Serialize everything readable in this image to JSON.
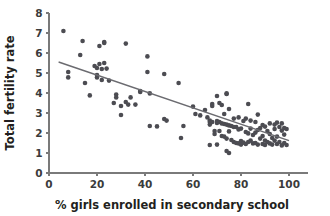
{
  "chart_data": {
    "type": "scatter",
    "title": "",
    "subtitle": "",
    "xlabel": "% girls enrolled in secondary school",
    "ylabel": "Total fertility rate",
    "xlim": [
      0,
      108
    ],
    "ylim": [
      0,
      8
    ],
    "xticks": [
      0,
      20,
      40,
      60,
      80,
      100
    ],
    "yticks": [
      0,
      1,
      2,
      3,
      4,
      5,
      6,
      7,
      8
    ],
    "xtick_labels": [
      "0",
      "20",
      "40",
      "60",
      "80",
      "100"
    ],
    "ytick_labels": [
      "0",
      "1",
      "2",
      "3",
      "4",
      "5",
      "6",
      "7",
      "8"
    ],
    "grid": false,
    "legend": null,
    "legend_position": "none",
    "marker_color": "#4c4c52",
    "marker_size": 2.3,
    "trendline": {
      "type": "linear-fit",
      "x": [
        4,
        100
      ],
      "y": [
        5.55,
        1.62
      ],
      "color": "#6b6b70",
      "slope": -0.0409,
      "intercept": 5.714
    },
    "points": [
      [
        6,
        7.1
      ],
      [
        8,
        5.05
      ],
      [
        8,
        4.78
      ],
      [
        13,
        5.9
      ],
      [
        14,
        6.6
      ],
      [
        15,
        4.5
      ],
      [
        17,
        3.88
      ],
      [
        19,
        5.35
      ],
      [
        20,
        5.25
      ],
      [
        20,
        4.9
      ],
      [
        20,
        4.78
      ],
      [
        21,
        6.35
      ],
      [
        21,
        5.45
      ],
      [
        22,
        5.2
      ],
      [
        22,
        4.65
      ],
      [
        23,
        6.55
      ],
      [
        23,
        6.5
      ],
      [
        23,
        5.5
      ],
      [
        24,
        5.22
      ],
      [
        25,
        4.62
      ],
      [
        27,
        3.5
      ],
      [
        28,
        3.92
      ],
      [
        28,
        3.78
      ],
      [
        30,
        3.35
      ],
      [
        30,
        2.9
      ],
      [
        32,
        6.47
      ],
      [
        32,
        3.55
      ],
      [
        33,
        3.42
      ],
      [
        34,
        3.78
      ],
      [
        36,
        3.42
      ],
      [
        38,
        4.1
      ],
      [
        38,
        4.05
      ],
      [
        41,
        5.83
      ],
      [
        41,
        5.05
      ],
      [
        42,
        3.98
      ],
      [
        42,
        2.35
      ],
      [
        45,
        2.33
      ],
      [
        48,
        4.95
      ],
      [
        48,
        2.7
      ],
      [
        49,
        2.62
      ],
      [
        54,
        4.5
      ],
      [
        55,
        1.75
      ],
      [
        56,
        2.35
      ],
      [
        60,
        3.32
      ],
      [
        61,
        2.95
      ],
      [
        63,
        2.88
      ],
      [
        65,
        3.15
      ],
      [
        66,
        2.78
      ],
      [
        67,
        2.62
      ],
      [
        67,
        2.55
      ],
      [
        67,
        2.42
      ],
      [
        67,
        1.4
      ],
      [
        68,
        3.45
      ],
      [
        68,
        3.35
      ],
      [
        68,
        2.55
      ],
      [
        69,
        2.1
      ],
      [
        69,
        1.95
      ],
      [
        70,
        3.85
      ],
      [
        70,
        2.6
      ],
      [
        70,
        2.5
      ],
      [
        70,
        1.42
      ],
      [
        71,
        3.5
      ],
      [
        71,
        2.55
      ],
      [
        71,
        2.1
      ],
      [
        72,
        3.4
      ],
      [
        72,
        2.48
      ],
      [
        72,
        1.85
      ],
      [
        73,
        2.95
      ],
      [
        73,
        2.45
      ],
      [
        73,
        1.82
      ],
      [
        74,
        3.95
      ],
      [
        74,
        3.98
      ],
      [
        74,
        2.42
      ],
      [
        74,
        1.72
      ],
      [
        74,
        1.1
      ],
      [
        75,
        3.2
      ],
      [
        75,
        2.38
      ],
      [
        75,
        2.08
      ],
      [
        75,
        1.0
      ],
      [
        76,
        2.35
      ],
      [
        76,
        1.65
      ],
      [
        77,
        2.72
      ],
      [
        77,
        2.3
      ],
      [
        77,
        1.55
      ],
      [
        78,
        2.3
      ],
      [
        78,
        1.5
      ],
      [
        79,
        2.78
      ],
      [
        79,
        2.18
      ],
      [
        79,
        1.48
      ],
      [
        80,
        2.22
      ],
      [
        80,
        1.6
      ],
      [
        80,
        1.42
      ],
      [
        81,
        2.6
      ],
      [
        81,
        1.52
      ],
      [
        82,
        2.72
      ],
      [
        82,
        2.05
      ],
      [
        82,
        1.45
      ],
      [
        83,
        3.45
      ],
      [
        83,
        1.98
      ],
      [
        83,
        1.55
      ],
      [
        84,
        2.62
      ],
      [
        84,
        2.22
      ],
      [
        84,
        1.62
      ],
      [
        85,
        1.9
      ],
      [
        85,
        1.48
      ],
      [
        86,
        2.55
      ],
      [
        86,
        2.02
      ],
      [
        86,
        1.5
      ],
      [
        87,
        2.92
      ],
      [
        87,
        2.15
      ],
      [
        87,
        1.42
      ],
      [
        88,
        2.25
      ],
      [
        88,
        1.72
      ],
      [
        89,
        2.4
      ],
      [
        89,
        1.85
      ],
      [
        89,
        1.45
      ],
      [
        90,
        2.32
      ],
      [
        90,
        1.62
      ],
      [
        90,
        1.4
      ],
      [
        91,
        2.1
      ],
      [
        91,
        1.55
      ],
      [
        92,
        2.48
      ],
      [
        92,
        1.95
      ],
      [
        92,
        1.48
      ],
      [
        93,
        1.75
      ],
      [
        93,
        1.42
      ],
      [
        94,
        2.42
      ],
      [
        94,
        2.2
      ],
      [
        94,
        1.62
      ],
      [
        95,
        2.52
      ],
      [
        95,
        1.82
      ],
      [
        95,
        1.45
      ],
      [
        96,
        2.3
      ],
      [
        96,
        1.55
      ],
      [
        97,
        2.48
      ],
      [
        97,
        2.12
      ],
      [
        97,
        1.38
      ],
      [
        98,
        2.25
      ],
      [
        98,
        1.92
      ],
      [
        98,
        1.5
      ],
      [
        99,
        2.2
      ],
      [
        99,
        1.4
      ]
    ]
  },
  "axes": {
    "x_title": "% girls enrolled in secondary school",
    "y_title": "Total fertility rate"
  }
}
